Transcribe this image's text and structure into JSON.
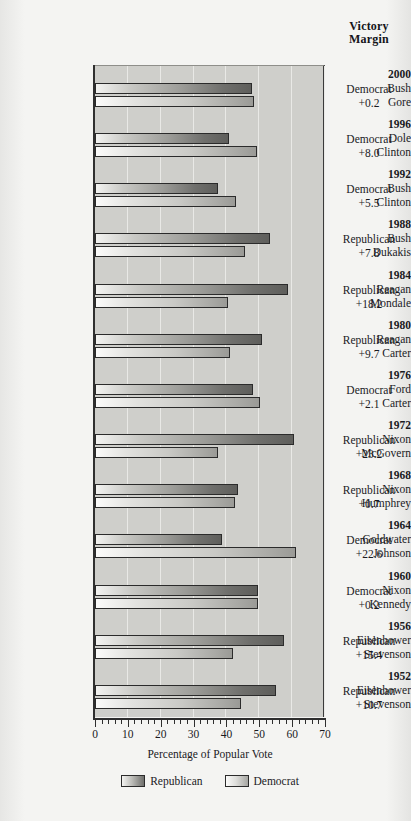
{
  "header": {
    "victory_margin_line1": "Victory",
    "victory_margin_line2": "Margin"
  },
  "axis": {
    "x_title": "Percentage of Popular Vote",
    "x_ticks": [
      "0",
      "10",
      "20",
      "30",
      "40",
      "50",
      "60",
      "70"
    ]
  },
  "legend": {
    "republican": "Republican",
    "democrat": "Democrat"
  },
  "chart_data": {
    "type": "bar",
    "orientation": "horizontal",
    "title": "",
    "xlabel": "Percentage of Popular Vote",
    "ylabel": "",
    "xlim": [
      0,
      70
    ],
    "xticks": [
      0,
      10,
      20,
      30,
      40,
      50,
      60,
      70
    ],
    "grid": true,
    "legend_position": "bottom",
    "legend": [
      "Republican",
      "Democrat"
    ],
    "elections": [
      {
        "year": "2000",
        "republican_name": "Bush",
        "republican_value": 47.9,
        "democrat_name": "Gore",
        "democrat_value": 48.4,
        "victory_party": "Democrat",
        "victory_margin": "+0.2"
      },
      {
        "year": "1996",
        "republican_name": "Dole",
        "republican_value": 40.7,
        "democrat_name": "Clinton",
        "democrat_value": 49.2,
        "victory_party": "Democrat",
        "victory_margin": "+8.0"
      },
      {
        "year": "1992",
        "republican_name": "Bush",
        "republican_value": 37.4,
        "democrat_name": "Clinton",
        "democrat_value": 43.0,
        "victory_party": "Democrat",
        "victory_margin": "+5.5"
      },
      {
        "year": "1988",
        "republican_name": "Bush",
        "republican_value": 53.4,
        "democrat_name": "Dukakis",
        "democrat_value": 45.6,
        "victory_party": "Republican",
        "victory_margin": "+7.8"
      },
      {
        "year": "1984",
        "republican_name": "Reagan",
        "republican_value": 58.8,
        "democrat_name": "Mondale",
        "democrat_value": 40.6,
        "victory_party": "Republican",
        "victory_margin": "+18.2"
      },
      {
        "year": "1980",
        "republican_name": "Reagan",
        "republican_value": 50.7,
        "democrat_name": "Carter",
        "democrat_value": 41.0,
        "victory_party": "Republican",
        "victory_margin": "+9.7"
      },
      {
        "year": "1976",
        "republican_name": "Ford",
        "republican_value": 48.0,
        "democrat_name": "Carter",
        "democrat_value": 50.1,
        "victory_party": "Democrat",
        "victory_margin": "+2.1"
      },
      {
        "year": "1972",
        "republican_name": "Nixon",
        "republican_value": 60.7,
        "democrat_name": "McGovern",
        "democrat_value": 37.5,
        "victory_party": "Republican",
        "victory_margin": "+23.2"
      },
      {
        "year": "1968",
        "republican_name": "Nixon",
        "republican_value": 43.4,
        "democrat_name": "Humphrey",
        "democrat_value": 42.7,
        "victory_party": "Republican",
        "victory_margin": "+0.7"
      },
      {
        "year": "1964",
        "republican_name": "Goldwater",
        "republican_value": 38.5,
        "democrat_name": "Johnson",
        "democrat_value": 61.1,
        "victory_party": "Democrat",
        "victory_margin": "+22.6"
      },
      {
        "year": "1960",
        "republican_name": "Nixon",
        "republican_value": 49.5,
        "democrat_name": "Kennedy",
        "democrat_value": 49.7,
        "victory_party": "Democrat",
        "victory_margin": "+0.2"
      },
      {
        "year": "1956",
        "republican_name": "Eisenhower",
        "republican_value": 57.4,
        "democrat_name": "Stevenson",
        "democrat_value": 42.0,
        "victory_party": "Republican",
        "victory_margin": "+15.4"
      },
      {
        "year": "1952",
        "republican_name": "Eisenhower",
        "republican_value": 55.1,
        "democrat_name": "Stevenson",
        "democrat_value": 44.4,
        "victory_party": "Republican",
        "victory_margin": "+10.7"
      }
    ]
  }
}
